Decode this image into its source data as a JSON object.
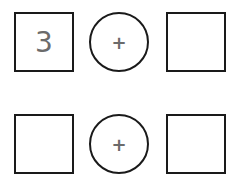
{
  "rows": [
    {
      "left": "3",
      "operator": "+",
      "right": ""
    },
    {
      "left": "",
      "operator": "+",
      "right": ""
    }
  ]
}
